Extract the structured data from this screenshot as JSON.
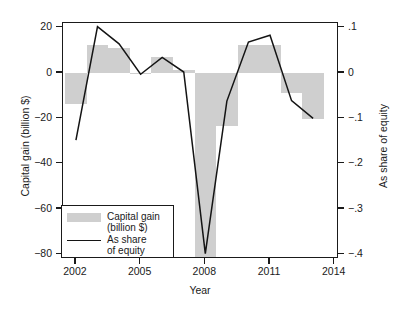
{
  "chart_data": {
    "type": "bar",
    "title": "",
    "xlabel": "Year",
    "ylabel": "Capital gain (billion $)",
    "ylabel_right": "As share of equity",
    "grid": false,
    "legend_position": "lower-left",
    "x": [
      2002,
      2003,
      2004,
      2005,
      2006,
      2007,
      2008,
      2009,
      2010,
      2011,
      2012,
      2013
    ],
    "xlim": [
      2001.4,
      2014.2
    ],
    "xticks": [
      2002,
      2005,
      2008,
      2011,
      2014
    ],
    "xtick_labels": [
      "2002",
      "2005",
      "2008",
      "2011",
      "2014"
    ],
    "ylim": [
      -82,
      22
    ],
    "yticks": [
      20,
      0,
      -20,
      -40,
      -60,
      -80
    ],
    "ytick_labels": [
      "20",
      "0",
      "-20",
      "-40",
      "-60",
      "-80"
    ],
    "ylim_right": [
      -0.41,
      0.11
    ],
    "yticks_right": [
      0.1,
      0.0,
      -0.1,
      -0.2,
      -0.3,
      -0.4
    ],
    "ytick_labels_right": [
      ".1",
      "0",
      "-.1",
      "-.2",
      "-.3",
      "-.4"
    ],
    "series": [
      {
        "name": "Capital gain (billion $)",
        "kind": "bar",
        "axis": "left",
        "color": "#cfcfcf",
        "values": [
          -13.5,
          12.2,
          11.0,
          -0.3,
          7.2,
          1.3,
          -81.0,
          -23.5,
          12.3,
          12.3,
          -9.0,
          -20.5
        ]
      },
      {
        "name": "As share of equity",
        "kind": "line",
        "axis": "right",
        "color": "#141414",
        "values": [
          -0.148,
          0.102,
          0.064,
          -0.003,
          0.034,
          0.002,
          -0.398,
          -0.062,
          0.068,
          0.083,
          -0.061,
          -0.1
        ]
      }
    ]
  },
  "legend": {
    "entries": [
      {
        "label": "Capital gain\n(billion $)",
        "glyph": "swatch"
      },
      {
        "label": "As share\nof equity",
        "glyph": "line"
      }
    ]
  },
  "axes": {
    "left_title": "Capital gain (billion $)",
    "right_title": "As share of equity",
    "bottom_title": "Year"
  }
}
